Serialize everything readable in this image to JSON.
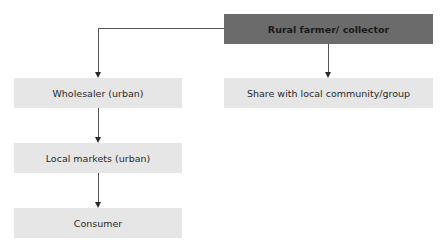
{
  "diagram": {
    "type": "flowchart",
    "nodes": [
      {
        "id": "farmer",
        "label": "Rural farmer/ collector",
        "style": "dark"
      },
      {
        "id": "wholesaler",
        "label": "Wholesaler (urban)",
        "style": "light"
      },
      {
        "id": "share",
        "label": "Share with local community/group",
        "style": "light"
      },
      {
        "id": "markets",
        "label": "Local markets (urban)",
        "style": "light"
      },
      {
        "id": "consumer",
        "label": "Consumer",
        "style": "light"
      }
    ],
    "edges": [
      {
        "from": "farmer",
        "to": "wholesaler"
      },
      {
        "from": "farmer",
        "to": "share"
      },
      {
        "from": "wholesaler",
        "to": "markets"
      },
      {
        "from": "markets",
        "to": "consumer"
      }
    ],
    "colors": {
      "dark_box": "#6b6b6b",
      "light_box": "#e6e6e6",
      "connector": "#555555"
    }
  }
}
